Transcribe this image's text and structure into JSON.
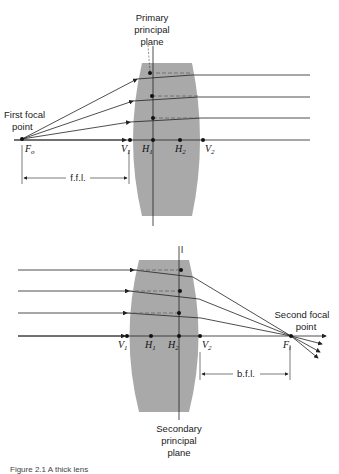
{
  "top_diagram": {
    "title_label": [
      "Primary",
      "principal",
      "plane"
    ],
    "focal_label": [
      "First focal",
      "point"
    ],
    "points": {
      "Fo": {
        "main": "F",
        "sub": "o"
      },
      "V1": {
        "main": "V",
        "sub": "1"
      },
      "H1": {
        "main": "H",
        "sub": "1"
      },
      "H2": {
        "main": "H",
        "sub": "2"
      },
      "V2": {
        "main": "V",
        "sub": "2"
      }
    },
    "distance_label": "f.f.l."
  },
  "bottom_diagram": {
    "title_label": [
      "Secondary",
      "principal",
      "plane"
    ],
    "focal_label": [
      "Second focal",
      "point"
    ],
    "points": {
      "V1": {
        "main": "V",
        "sub": "1"
      },
      "H1": {
        "main": "H",
        "sub": "1"
      },
      "H2": {
        "main": "H",
        "sub": "2"
      },
      "V2": {
        "main": "V",
        "sub": "2"
      },
      "Fi": {
        "main": "F",
        "sub": "i"
      }
    },
    "distance_label": "b.f.l.",
    "plane_marker": "l"
  },
  "caption": "Figure 2.1  A thick lens",
  "colors": {
    "lens": "#a9a9a9",
    "line": "#222222",
    "dashed": "#777777"
  }
}
